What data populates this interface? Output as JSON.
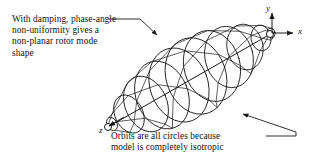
{
  "figure": {
    "kind": "technical-line-diagram",
    "background_color": "#ffffff",
    "line_color": "#1a1a1a",
    "text_color": "#141414"
  },
  "annotations": {
    "top": {
      "name": "damping-phase-angle-note",
      "lines": [
        "With damping, phase-angle",
        "non-uniformity gives a",
        "non-planar rotor mode",
        "shape"
      ],
      "full_text": "With damping, phase-angle non-uniformity gives a non-planar rotor mode shape",
      "leader": "horizontal then diagonal down-right to arrowhead on upper rotor envelope"
    },
    "bottom": {
      "name": "isotropic-orbits-note",
      "lines": [
        "Orbits are all circles because",
        "model is completely isotropic"
      ],
      "full_text": "Orbits are all circles because model is completely isotropic",
      "leader": "horizontal then diagonal up-left to arrowhead below rotor envelope"
    }
  },
  "axes": {
    "origin": {
      "x": 272,
      "y": 33
    },
    "labels": [
      {
        "name": "y-axis",
        "text": "y",
        "direction": "up"
      },
      {
        "name": "x-axis",
        "text": "x",
        "direction": "right"
      },
      {
        "name": "z-axis",
        "text": "z",
        "direction": "down-left"
      }
    ]
  },
  "chart_data": {
    "type": "line",
    "title": "Non-planar rotor mode shape",
    "xlabel": "",
    "ylabel": "",
    "axis_endpoints": {
      "rotor_axis_start": {
        "x": 108,
        "y": 127
      },
      "rotor_axis_end": {
        "x": 272,
        "y": 33
      }
    },
    "orbit_count": 11,
    "orbits": [
      {
        "index": 1,
        "t": 0.0,
        "cx": 112,
        "cy": 124,
        "rx": 5,
        "ry": 7,
        "rot": -28,
        "phase": 0
      },
      {
        "index": 2,
        "t": 0.1,
        "cx": 129,
        "cy": 114,
        "rx": 14,
        "ry": 20,
        "rot": -26,
        "phase": 32
      },
      {
        "index": 3,
        "t": 0.2,
        "cx": 146,
        "cy": 104,
        "rx": 21,
        "ry": 29,
        "rot": -24,
        "phase": 64
      },
      {
        "index": 4,
        "t": 0.3,
        "cx": 162,
        "cy": 95,
        "rx": 26,
        "ry": 35,
        "rot": -22,
        "phase": 96
      },
      {
        "index": 5,
        "t": 0.4,
        "cx": 179,
        "cy": 85,
        "rx": 29,
        "ry": 38,
        "rot": -20,
        "phase": 128
      },
      {
        "index": 6,
        "t": 0.5,
        "cx": 196,
        "cy": 76,
        "rx": 30,
        "ry": 39,
        "rot": -18,
        "phase": 160
      },
      {
        "index": 7,
        "t": 0.6,
        "cx": 212,
        "cy": 66,
        "rx": 28,
        "ry": 36,
        "rot": -16,
        "phase": 192
      },
      {
        "index": 8,
        "t": 0.7,
        "cx": 229,
        "cy": 57,
        "rx": 24,
        "ry": 31,
        "rot": -14,
        "phase": 224
      },
      {
        "index": 9,
        "t": 0.8,
        "cx": 245,
        "cy": 47,
        "rx": 18,
        "ry": 23,
        "rot": -12,
        "phase": 256
      },
      {
        "index": 10,
        "t": 0.9,
        "cx": 261,
        "cy": 38,
        "rx": 10,
        "ry": 13,
        "rot": -10,
        "phase": 288
      },
      {
        "index": 11,
        "t": 1.0,
        "cx": 271,
        "cy": 33,
        "rx": 4,
        "ry": 5,
        "rot": -8,
        "phase": 320
      }
    ],
    "end_markers": [
      {
        "name": "z-end-node-circle",
        "cx": 108,
        "cy": 127,
        "r": 3.5
      },
      {
        "name": "origin-node-circle",
        "cx": 270,
        "cy": 34,
        "r": 3.5
      }
    ],
    "grid": false,
    "legend": false
  }
}
